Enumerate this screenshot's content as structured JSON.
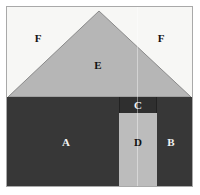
{
  "figure": {
    "canvas": {
      "width": 200,
      "height": 195,
      "frame_color": "#a9a9a9",
      "background_color": "#ffffff"
    }
  },
  "palette": {
    "sky": "#f7f7f5",
    "roof": "#b6b6b6",
    "roof_outline": "#8a8a8a",
    "wall": "#373737",
    "lintel": "#2f2f2f",
    "door": "#bcbcbc",
    "label_dark": "#111111",
    "label_light": "#f2f2f2"
  },
  "geometry": {
    "roof": {
      "apex_x": 92,
      "apex_y": 4,
      "base_left_x": 1,
      "base_right_x": 184,
      "base_y": 90
    },
    "wall_top_y": 90,
    "door": {
      "x": 112,
      "y": 106,
      "width": 38,
      "height": 74
    },
    "lintel": {
      "x": 112,
      "y": 90,
      "width": 38,
      "height": 16
    }
  },
  "regions": [
    {
      "id": "A",
      "label": "A",
      "name": "wall-left",
      "tone": "dark",
      "x": 59,
      "y": 135
    },
    {
      "id": "B",
      "label": "B",
      "name": "wall-right",
      "tone": "dark",
      "x": 164,
      "y": 135
    },
    {
      "id": "C",
      "label": "C",
      "name": "lintel",
      "tone": "dark",
      "x": 131,
      "y": 98
    },
    {
      "id": "D",
      "label": "D",
      "name": "door",
      "tone": "light",
      "x": 131,
      "y": 135
    },
    {
      "id": "E",
      "label": "E",
      "name": "roof",
      "tone": "light",
      "x": 91,
      "y": 58
    },
    {
      "id": "F",
      "label": "F",
      "name": "sky-left",
      "tone": "light",
      "x": 31,
      "y": 31
    },
    {
      "id": "F2",
      "label": "F",
      "name": "sky-right",
      "tone": "light",
      "x": 154,
      "y": 31
    }
  ]
}
